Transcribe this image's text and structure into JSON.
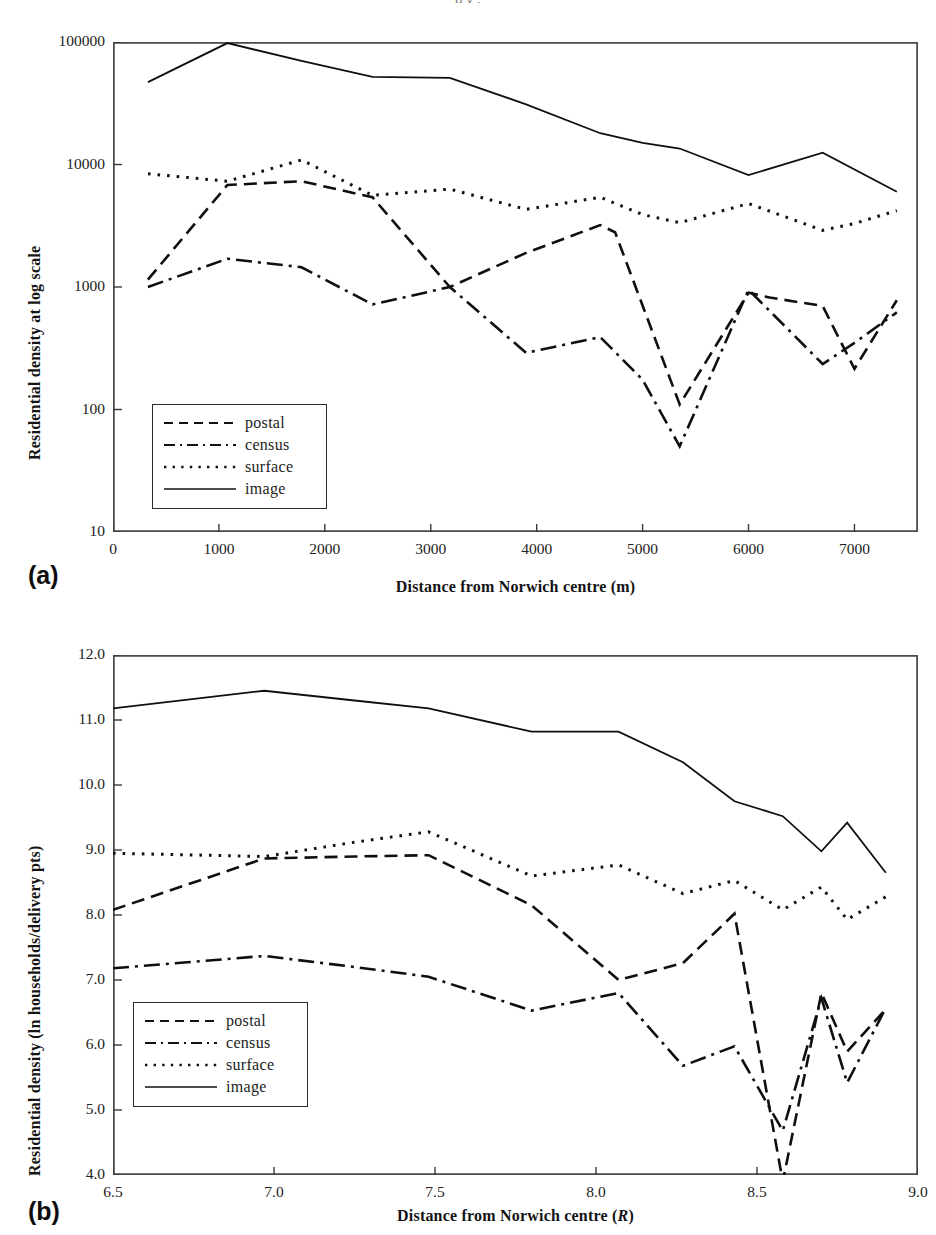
{
  "figure": {
    "bleed_text": "g    y ,",
    "panels": [
      {
        "letter": "(a)",
        "xlabel": "Distance from Norwich centre (m)",
        "ylabel": "Residential density at log scale"
      },
      {
        "letter": "(b)",
        "xlabel_prefix": "Distance from Norwich centre (",
        "xlabel_italic": "R",
        "xlabel_suffix": ")",
        "ylabel": "Residential density (ln households/delivery pts)"
      }
    ]
  },
  "legend": {
    "items": [
      {
        "label": "postal",
        "key": "dashed"
      },
      {
        "label": "census",
        "key": "dash-dot"
      },
      {
        "label": "surface",
        "key": "dotted"
      },
      {
        "label": "image",
        "key": "solid"
      }
    ]
  },
  "chart_data": [
    {
      "type": "line",
      "title": "",
      "panel": "(a)",
      "xlabel": "Distance from Norwich centre (m)",
      "ylabel": "Residential density at log scale",
      "yscale": "log",
      "xlim": [
        0,
        7600
      ],
      "ylim": [
        10,
        100000
      ],
      "xticks": [
        0,
        1000,
        2000,
        3000,
        4000,
        5000,
        6000,
        7000
      ],
      "xticklabels": [
        "0",
        "1000",
        "2000",
        "3000",
        "4000",
        "5000",
        "6000",
        "7000"
      ],
      "yticks": [
        10,
        100,
        1000,
        10000,
        100000
      ],
      "yticklabels": [
        "10",
        "100",
        "1000",
        "10000",
        "100000"
      ],
      "grid": false,
      "legend_position": "lower-left",
      "series": [
        {
          "name": "postal",
          "style": "dashed",
          "x": [
            330,
            1080,
            1780,
            2450,
            3180,
            3900,
            4600,
            4740,
            5350,
            6000,
            6200,
            6700,
            7000,
            7400
          ],
          "y": [
            1150,
            6800,
            7300,
            5400,
            1000,
            1900,
            3200,
            2800,
            110,
            900,
            820,
            700,
            215,
            780
          ]
        },
        {
          "name": "census",
          "style": "dash-dot",
          "x": [
            330,
            1080,
            1780,
            2450,
            3180,
            3900,
            4600,
            5000,
            5350,
            6000,
            6700,
            7000,
            7400
          ],
          "y": [
            1000,
            1700,
            1450,
            720,
            1000,
            290,
            390,
            175,
            50,
            950,
            235,
            350,
            620
          ]
        },
        {
          "name": "surface",
          "style": "dotted",
          "x": [
            330,
            1080,
            1780,
            2450,
            3180,
            3900,
            4600,
            5000,
            5350,
            6000,
            6700,
            7000,
            7400
          ],
          "y": [
            8400,
            7300,
            10900,
            5600,
            6300,
            4300,
            5400,
            3900,
            3350,
            4800,
            2900,
            3300,
            4200
          ]
        },
        {
          "name": "image",
          "style": "solid",
          "x": [
            330,
            1080,
            1780,
            2450,
            3180,
            3900,
            4600,
            5000,
            5350,
            6000,
            6700,
            7400
          ],
          "y": [
            47000,
            98000,
            70000,
            52000,
            51000,
            31000,
            18000,
            15000,
            13500,
            8200,
            12500,
            6000
          ]
        }
      ]
    },
    {
      "type": "line",
      "title": "",
      "panel": "(b)",
      "xlabel": "Distance from Norwich centre (R)",
      "ylabel": "Residential density (ln households/delivery pts)",
      "yscale": "linear",
      "xlim": [
        6.5,
        9.0
      ],
      "ylim": [
        4.0,
        12.0
      ],
      "xticks": [
        6.5,
        7.0,
        7.5,
        8.0,
        8.5,
        9.0
      ],
      "xticklabels": [
        "6.5",
        "7.0",
        "7.5",
        "8.0",
        "8.5",
        "9.0"
      ],
      "yticks": [
        4.0,
        5.0,
        6.0,
        7.0,
        8.0,
        9.0,
        10.0,
        11.0,
        12.0
      ],
      "yticklabels": [
        "4.0",
        "5.0",
        "6.0",
        "7.0",
        "8.0",
        "9.0",
        "10.0",
        "11.0",
        "12.0"
      ],
      "grid": false,
      "legend_position": "lower-left",
      "series": [
        {
          "name": "postal",
          "style": "dashed",
          "x": [
            6.5,
            6.97,
            7.25,
            7.48,
            7.8,
            8.07,
            8.27,
            8.43,
            8.58,
            8.7,
            8.78,
            8.9
          ],
          "y": [
            8.08,
            8.87,
            8.9,
            8.92,
            8.15,
            7.0,
            7.26,
            8.02,
            3.9,
            6.8,
            5.9,
            6.55
          ]
        },
        {
          "name": "census",
          "style": "dash-dot",
          "x": [
            6.5,
            6.97,
            7.25,
            7.48,
            7.8,
            8.07,
            8.27,
            8.43,
            8.58,
            8.7,
            8.78,
            8.9
          ],
          "y": [
            7.18,
            7.37,
            7.2,
            7.05,
            6.53,
            6.8,
            5.68,
            5.98,
            4.68,
            6.72,
            5.42,
            6.57
          ]
        },
        {
          "name": "surface",
          "style": "dotted",
          "x": [
            6.5,
            6.97,
            7.25,
            7.48,
            7.8,
            8.07,
            8.27,
            8.43,
            8.58,
            8.7,
            8.78,
            8.9
          ],
          "y": [
            8.95,
            8.9,
            9.12,
            9.28,
            8.6,
            8.77,
            8.33,
            8.53,
            8.08,
            8.43,
            7.93,
            8.28
          ]
        },
        {
          "name": "image",
          "style": "solid",
          "x": [
            6.5,
            6.97,
            7.25,
            7.48,
            7.8,
            8.07,
            8.27,
            8.43,
            8.58,
            8.7,
            8.78,
            8.9
          ],
          "y": [
            11.18,
            11.45,
            11.3,
            11.18,
            10.82,
            10.82,
            10.35,
            9.75,
            9.52,
            8.98,
            9.42,
            8.65
          ]
        }
      ]
    }
  ]
}
